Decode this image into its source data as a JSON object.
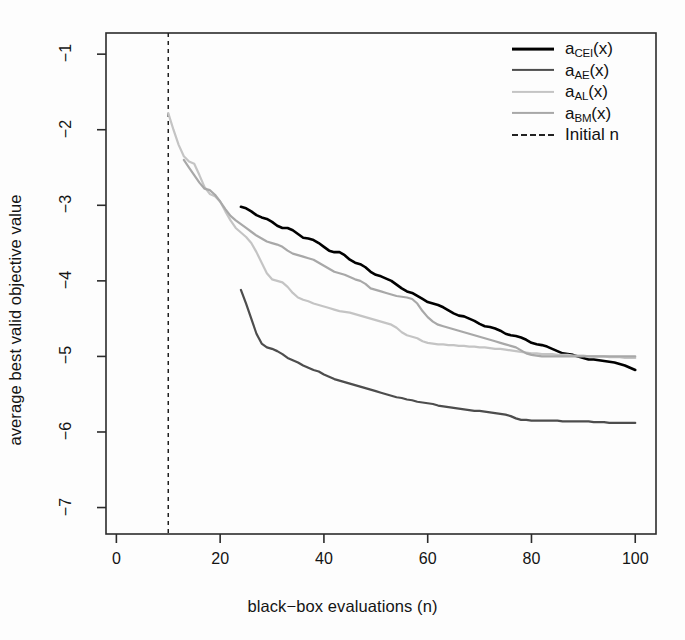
{
  "chart_data": {
    "type": "line",
    "title": "",
    "xlabel": "black−box evaluations (n)",
    "ylabel": "average best valid objective value",
    "xlim": [
      -2,
      104
    ],
    "ylim": [
      -7.35,
      -0.72
    ],
    "xticks": [
      0,
      20,
      40,
      60,
      80,
      100
    ],
    "xtick_labels": [
      "0",
      "20",
      "40",
      "60",
      "80",
      "100"
    ],
    "yticks": [
      -1,
      -2,
      -3,
      -4,
      -5,
      -6,
      -7
    ],
    "ytick_labels": [
      "−1",
      "−2",
      "−3",
      "−4",
      "−5",
      "−6",
      "−7"
    ],
    "grid": false,
    "legend_position": "top-right",
    "annotations": [
      {
        "name": "initial-design-line",
        "type": "vline",
        "x": 10,
        "style": "dashed",
        "label": "Initial n"
      }
    ],
    "series": [
      {
        "name": "a_CEI(x)",
        "label_base": "a",
        "label_sub": "CEI",
        "label_tail": "(x)",
        "color": "#000000",
        "width": 2.6,
        "dash": "none",
        "x": [
          24,
          25,
          26,
          27,
          28,
          29,
          30,
          31,
          32,
          33,
          34,
          35,
          36,
          37,
          38,
          39,
          40,
          41,
          42,
          43,
          44,
          45,
          46,
          47,
          48,
          49,
          50,
          51,
          52,
          53,
          54,
          55,
          56,
          57,
          58,
          59,
          60,
          61,
          62,
          63,
          64,
          65,
          66,
          67,
          68,
          69,
          70,
          71,
          72,
          73,
          74,
          75,
          76,
          77,
          78,
          79,
          80,
          81,
          82,
          83,
          84,
          85,
          86,
          87,
          88,
          89,
          90,
          91,
          92,
          93,
          94,
          95,
          96,
          97,
          98,
          99,
          100
        ],
        "y": [
          -3.02,
          -3.04,
          -3.08,
          -3.13,
          -3.16,
          -3.18,
          -3.22,
          -3.27,
          -3.3,
          -3.3,
          -3.33,
          -3.38,
          -3.43,
          -3.44,
          -3.46,
          -3.5,
          -3.55,
          -3.6,
          -3.62,
          -3.62,
          -3.66,
          -3.72,
          -3.76,
          -3.78,
          -3.82,
          -3.88,
          -3.92,
          -3.94,
          -3.97,
          -4.0,
          -4.05,
          -4.1,
          -4.14,
          -4.16,
          -4.2,
          -4.24,
          -4.28,
          -4.3,
          -4.32,
          -4.35,
          -4.39,
          -4.43,
          -4.46,
          -4.47,
          -4.5,
          -4.53,
          -4.57,
          -4.6,
          -4.61,
          -4.63,
          -4.66,
          -4.7,
          -4.72,
          -4.73,
          -4.75,
          -4.78,
          -4.82,
          -4.84,
          -4.85,
          -4.87,
          -4.9,
          -4.93,
          -4.96,
          -4.97,
          -4.98,
          -5.0,
          -5.02,
          -5.04,
          -5.04,
          -5.05,
          -5.06,
          -5.07,
          -5.08,
          -5.1,
          -5.12,
          -5.15,
          -5.18
        ]
      },
      {
        "name": "a_AE(x)",
        "label_base": "a",
        "label_sub": "AE",
        "label_tail": "(x)",
        "color": "#4d4d4d",
        "width": 2.2,
        "dash": "none",
        "x": [
          24,
          25,
          26,
          27,
          28,
          29,
          30,
          31,
          32,
          33,
          34,
          35,
          36,
          37,
          38,
          39,
          40,
          41,
          42,
          43,
          44,
          45,
          46,
          47,
          48,
          49,
          50,
          51,
          52,
          53,
          54,
          55,
          56,
          57,
          58,
          59,
          60,
          61,
          62,
          63,
          64,
          65,
          66,
          67,
          68,
          69,
          70,
          71,
          72,
          73,
          74,
          75,
          76,
          77,
          78,
          79,
          80,
          81,
          82,
          83,
          84,
          85,
          86,
          87,
          88,
          89,
          90,
          91,
          92,
          93,
          94,
          95,
          96,
          97,
          98,
          99,
          100
        ],
        "y": [
          -4.12,
          -4.3,
          -4.5,
          -4.7,
          -4.83,
          -4.88,
          -4.9,
          -4.93,
          -4.97,
          -5.02,
          -5.05,
          -5.08,
          -5.12,
          -5.15,
          -5.18,
          -5.2,
          -5.24,
          -5.27,
          -5.3,
          -5.32,
          -5.34,
          -5.36,
          -5.38,
          -5.4,
          -5.42,
          -5.44,
          -5.46,
          -5.48,
          -5.5,
          -5.52,
          -5.54,
          -5.55,
          -5.57,
          -5.58,
          -5.6,
          -5.61,
          -5.62,
          -5.63,
          -5.65,
          -5.66,
          -5.67,
          -5.68,
          -5.69,
          -5.7,
          -5.71,
          -5.72,
          -5.72,
          -5.73,
          -5.74,
          -5.75,
          -5.76,
          -5.77,
          -5.79,
          -5.82,
          -5.84,
          -5.84,
          -5.85,
          -5.85,
          -5.85,
          -5.85,
          -5.85,
          -5.85,
          -5.86,
          -5.86,
          -5.86,
          -5.86,
          -5.86,
          -5.86,
          -5.87,
          -5.87,
          -5.87,
          -5.88,
          -5.88,
          -5.88,
          -5.88,
          -5.88,
          -5.88
        ]
      },
      {
        "name": "a_AL(x)",
        "label_base": "a",
        "label_sub": "AL",
        "label_tail": "(x)",
        "color": "#c4c4c4",
        "width": 2.2,
        "dash": "none",
        "x": [
          10,
          11,
          12,
          13,
          14,
          15,
          16,
          17,
          18,
          19,
          20,
          21,
          22,
          23,
          24,
          25,
          26,
          27,
          28,
          29,
          30,
          31,
          32,
          33,
          34,
          35,
          36,
          37,
          38,
          39,
          40,
          41,
          42,
          43,
          44,
          45,
          46,
          47,
          48,
          49,
          50,
          51,
          52,
          53,
          54,
          55,
          56,
          57,
          58,
          59,
          60,
          61,
          62,
          63,
          64,
          65,
          66,
          67,
          68,
          69,
          70,
          71,
          72,
          73,
          74,
          75,
          76,
          77,
          78,
          79,
          80,
          81,
          82,
          83,
          84,
          85,
          86,
          87,
          88,
          89,
          90,
          91,
          92,
          93,
          94,
          95,
          96,
          97,
          98,
          99,
          100
        ],
        "y": [
          -1.78,
          -2.0,
          -2.2,
          -2.35,
          -2.42,
          -2.45,
          -2.6,
          -2.76,
          -2.85,
          -2.88,
          -2.95,
          -3.08,
          -3.2,
          -3.3,
          -3.36,
          -3.42,
          -3.5,
          -3.62,
          -3.76,
          -3.9,
          -3.98,
          -4.0,
          -4.02,
          -4.08,
          -4.16,
          -4.22,
          -4.25,
          -4.27,
          -4.3,
          -4.32,
          -4.34,
          -4.36,
          -4.38,
          -4.4,
          -4.41,
          -4.42,
          -4.44,
          -4.46,
          -4.48,
          -4.5,
          -4.52,
          -4.54,
          -4.56,
          -4.58,
          -4.62,
          -4.68,
          -4.72,
          -4.74,
          -4.76,
          -4.8,
          -4.82,
          -4.83,
          -4.84,
          -4.84,
          -4.85,
          -4.85,
          -4.86,
          -4.86,
          -4.87,
          -4.87,
          -4.88,
          -4.88,
          -4.89,
          -4.9,
          -4.9,
          -4.91,
          -4.92,
          -4.93,
          -4.94,
          -4.95,
          -4.96,
          -4.96,
          -4.97,
          -4.97,
          -4.97,
          -4.98,
          -4.98,
          -4.98,
          -4.99,
          -4.99,
          -4.99,
          -5.0,
          -5.0,
          -5.0,
          -5.0,
          -5.01,
          -5.01,
          -5.01,
          -5.02,
          -5.02,
          -5.02
        ]
      },
      {
        "name": "a_BM(x)",
        "label_base": "a",
        "label_sub": "BM",
        "label_tail": "(x)",
        "color": "#a8a8a8",
        "width": 2.2,
        "dash": "none",
        "x": [
          13,
          14,
          15,
          16,
          17,
          18,
          19,
          20,
          21,
          22,
          23,
          24,
          25,
          26,
          27,
          28,
          29,
          30,
          31,
          32,
          33,
          34,
          35,
          36,
          37,
          38,
          39,
          40,
          41,
          42,
          43,
          44,
          45,
          46,
          47,
          48,
          49,
          50,
          51,
          52,
          53,
          54,
          55,
          56,
          57,
          58,
          59,
          60,
          61,
          62,
          63,
          64,
          65,
          66,
          67,
          68,
          69,
          70,
          71,
          72,
          73,
          74,
          75,
          76,
          77,
          78,
          79,
          80,
          81,
          82,
          83,
          84,
          85,
          86,
          87,
          88,
          89,
          90,
          91,
          92,
          93,
          94,
          95,
          96,
          97,
          98,
          99,
          100
        ],
        "y": [
          -2.4,
          -2.5,
          -2.6,
          -2.7,
          -2.78,
          -2.8,
          -2.86,
          -2.95,
          -3.05,
          -3.14,
          -3.2,
          -3.25,
          -3.3,
          -3.35,
          -3.4,
          -3.44,
          -3.48,
          -3.5,
          -3.52,
          -3.55,
          -3.6,
          -3.64,
          -3.66,
          -3.68,
          -3.7,
          -3.72,
          -3.76,
          -3.8,
          -3.84,
          -3.88,
          -3.9,
          -3.92,
          -3.95,
          -3.98,
          -4.0,
          -4.04,
          -4.1,
          -4.12,
          -4.14,
          -4.16,
          -4.18,
          -4.2,
          -4.21,
          -4.22,
          -4.24,
          -4.3,
          -4.4,
          -4.48,
          -4.54,
          -4.58,
          -4.6,
          -4.62,
          -4.64,
          -4.66,
          -4.68,
          -4.7,
          -4.72,
          -4.74,
          -4.76,
          -4.78,
          -4.8,
          -4.82,
          -4.84,
          -4.86,
          -4.88,
          -4.92,
          -4.96,
          -4.98,
          -4.99,
          -5.0,
          -5.0,
          -5.0,
          -5.0,
          -5.0,
          -5.0,
          -5.0,
          -5.0,
          -5.0,
          -5.0,
          -5.0,
          -5.0,
          -5.0,
          -5.0,
          -5.0,
          -5.0,
          -5.0,
          -5.0,
          -5.0
        ]
      }
    ],
    "legend": [
      {
        "name": "legend-item-cei",
        "text": "a",
        "sub": "CEI",
        "tail": "(x)",
        "color": "#000000",
        "dash": "none"
      },
      {
        "name": "legend-item-ae",
        "text": "a",
        "sub": "AE",
        "tail": "(x)",
        "color": "#4d4d4d",
        "dash": "none"
      },
      {
        "name": "legend-item-al",
        "text": "a",
        "sub": "AL",
        "tail": "(x)",
        "color": "#c4c4c4",
        "dash": "none"
      },
      {
        "name": "legend-item-bm",
        "text": "a",
        "sub": "BM",
        "tail": "(x)",
        "color": "#a8a8a8",
        "dash": "none"
      },
      {
        "name": "legend-item-initial",
        "text": "Initial n",
        "sub": "",
        "tail": "",
        "color": "#222222",
        "dash": "dashed"
      }
    ]
  },
  "axes": {
    "x_title": "black−box evaluations (n)",
    "y_title": "average best valid objective value"
  }
}
